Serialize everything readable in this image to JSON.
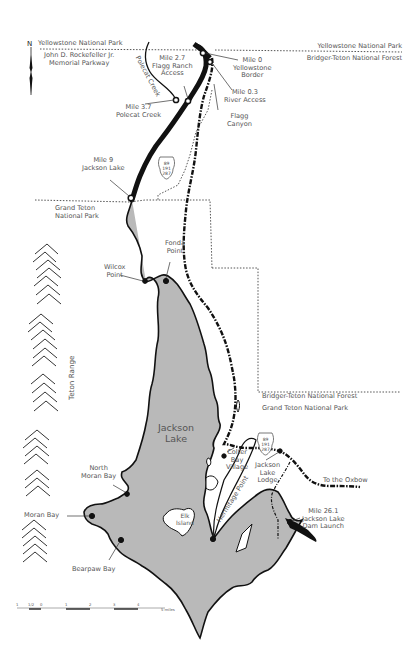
{
  "map": {
    "title_labels": {
      "north": "N",
      "yellowstone_nw": "Yellowstone National Park",
      "rockefeller": "John D. Rockefeller Jr.\nMemorial Parkway",
      "yellowstone_ne": "Yellowstone National Park",
      "bridger_teton_ne": "Bridger-Teton National Forest",
      "grand_teton_nw": "Grand Teton\nNational Park",
      "bridger_teton_se": "Bridger-Teton National Forest",
      "grand_teton_se": "Grand Teton National Park",
      "teton_range": "Teton Range",
      "lake": "Jackson\nLake",
      "polecat_creek": "Polecat Creek",
      "hermitage_point": "Hermitage Point",
      "elk_island": "Elk\nIsland",
      "to_oxbow": "To the Oxbow"
    },
    "points": [
      {
        "id": "mile-0",
        "label": "Mile 0\nYellowstone\nBorder"
      },
      {
        "id": "mile-0-3",
        "label": "Mile 0.3\nRiver Access"
      },
      {
        "id": "flagg-canyon",
        "label": "Flagg\nCanyon"
      },
      {
        "id": "mile-2-7",
        "label": "Mile 2.7\nFlagg Ranch\nAccess"
      },
      {
        "id": "mile-3-7",
        "label": "Mile 3.7\nPolecat Creek"
      },
      {
        "id": "mile-9",
        "label": "Mile 9\nJackson Lake"
      },
      {
        "id": "fonda-point",
        "label": "Fonda\nPoint"
      },
      {
        "id": "wilcox-point",
        "label": "Wilcox\nPoint"
      },
      {
        "id": "colter-bay",
        "label": "Colter\nBay\nVillage"
      },
      {
        "id": "jackson-lake-lodge",
        "label": "Jackson\nLake\nLodge"
      },
      {
        "id": "mile-26-1",
        "label": "Mile 26.1\nJackson Lake\nDam Launch"
      },
      {
        "id": "north-moran-bay",
        "label": "North\nMoran Bay"
      },
      {
        "id": "moran-bay",
        "label": "Moran Bay"
      },
      {
        "id": "bearpaw-bay",
        "label": "Bearpaw Bay"
      }
    ],
    "highway_shield": {
      "lines": [
        "89",
        "191",
        "287"
      ]
    },
    "scale_bar": {
      "ticks": [
        "1",
        "1/2",
        "0",
        "1",
        "2",
        "3",
        "4",
        "5 miles"
      ]
    },
    "colors": {
      "lake": "#b9b9b9",
      "river": "#111111",
      "road": "#111111",
      "boundary": "#444444",
      "text": "#555555"
    }
  }
}
